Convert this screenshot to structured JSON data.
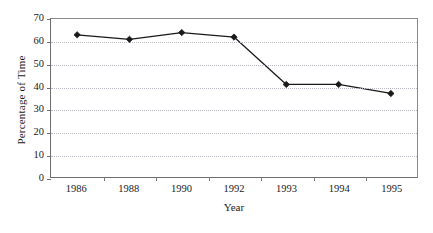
{
  "chart_data": {
    "type": "line",
    "title": "",
    "xlabel": "Year",
    "ylabel": "Percentage of Time",
    "categories": [
      "1986",
      "1988",
      "1990",
      "1992",
      "1993",
      "1994",
      "1995"
    ],
    "values": [
      63,
      61,
      64,
      62,
      41,
      41,
      37
    ],
    "series": [
      {
        "name": "Percentage of Time",
        "values": [
          63,
          61,
          64,
          62,
          41,
          41,
          37
        ],
        "marker": "diamond",
        "line_color": "#1a1a1a",
        "marker_color": "#1a1a1a"
      }
    ],
    "ylim": [
      0,
      70
    ],
    "yticks": [
      0,
      10,
      20,
      30,
      40,
      50,
      60,
      70
    ],
    "ytick_labels": [
      "0",
      "10",
      "20",
      "30",
      "40",
      "50",
      "60",
      "70"
    ],
    "grid": {
      "horizontal": true,
      "vertical": false,
      "style": "dotted",
      "color": "#b9b9c4"
    },
    "legend": {
      "visible": false,
      "position": "none"
    },
    "axis": {
      "frame": "full-box",
      "line_color": "#6e6e6e",
      "tick_direction": "out"
    },
    "background_color": "#ffffff"
  }
}
